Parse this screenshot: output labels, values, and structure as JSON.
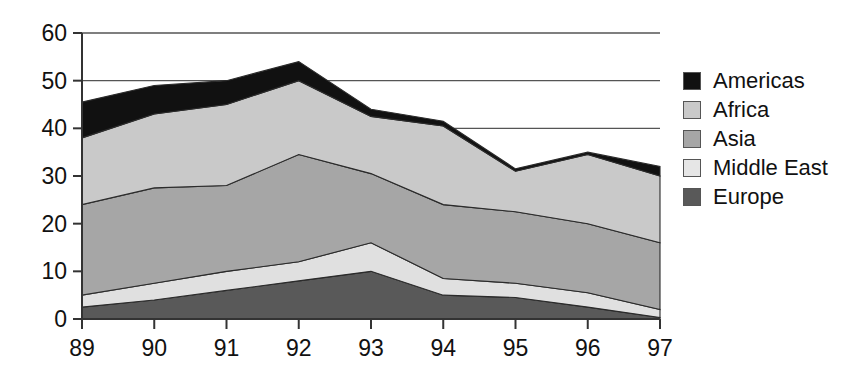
{
  "chart_data": {
    "type": "area",
    "stacked": true,
    "title": "",
    "xlabel": "",
    "ylabel": "",
    "categories": [
      "89",
      "90",
      "91",
      "92",
      "93",
      "94",
      "95",
      "96",
      "97"
    ],
    "x": [
      89,
      90,
      91,
      92,
      93,
      94,
      95,
      96,
      97
    ],
    "ylim": [
      0,
      60
    ],
    "yticks": [
      0,
      10,
      20,
      30,
      40,
      50,
      60
    ],
    "grid": "horizontal",
    "legend_position": "right",
    "stack_order_bottom_to_top": [
      "Europe",
      "Middle East",
      "Asia",
      "Africa",
      "Americas"
    ],
    "series": [
      {
        "name": "Europe",
        "color": "#595959",
        "values": [
          2.5,
          4.0,
          6.0,
          8.0,
          10.0,
          5.0,
          4.5,
          2.5,
          0.3
        ]
      },
      {
        "name": "Middle East",
        "color": "#e0e0e0",
        "values": [
          2.5,
          3.5,
          4.0,
          4.0,
          6.0,
          3.5,
          3.0,
          3.0,
          1.7
        ]
      },
      {
        "name": "Asia",
        "color": "#a6a6a6",
        "values": [
          19.0,
          20.0,
          18.0,
          22.5,
          14.5,
          15.5,
          15.0,
          14.5,
          14.0
        ]
      },
      {
        "name": "Africa",
        "color": "#c9c9c9",
        "values": [
          14.0,
          15.5,
          17.0,
          15.5,
          12.0,
          16.5,
          8.5,
          14.5,
          14.0
        ]
      },
      {
        "name": "Americas",
        "color": "#111111",
        "values": [
          7.5,
          6.0,
          5.0,
          4.0,
          1.5,
          1.0,
          0.5,
          0.5,
          2.0
        ]
      }
    ],
    "cumulative_tops": {
      "Europe": [
        2.5,
        4.0,
        6.0,
        8.0,
        10.0,
        5.0,
        4.5,
        2.5,
        0.3
      ],
      "Middle East": [
        5.0,
        7.5,
        10.0,
        12.0,
        16.0,
        8.5,
        7.5,
        5.5,
        2.0
      ],
      "Asia": [
        24.0,
        27.5,
        28.0,
        34.5,
        30.5,
        24.0,
        22.5,
        20.0,
        16.0
      ],
      "Africa": [
        38.0,
        43.0,
        45.0,
        50.0,
        42.5,
        40.5,
        31.0,
        34.5,
        30.0
      ],
      "Americas": [
        45.5,
        49.0,
        50.0,
        54.0,
        44.0,
        41.5,
        31.5,
        35.0,
        32.0
      ]
    },
    "totals": [
      45.5,
      49.0,
      50.0,
      54.0,
      44.0,
      41.5,
      31.5,
      35.0,
      32.0
    ],
    "axis_color": "#333333",
    "gridline_color": "#555555"
  },
  "legend": {
    "items": [
      {
        "label": "Americas",
        "color": "#111111"
      },
      {
        "label": "Africa",
        "color": "#c9c9c9"
      },
      {
        "label": "Asia",
        "color": "#a6a6a6"
      },
      {
        "label": "Middle East",
        "color": "#e6e6e6"
      },
      {
        "label": "Europe",
        "color": "#595959"
      }
    ]
  },
  "axes": {
    "y_tick_labels": [
      "60",
      "50",
      "40",
      "30",
      "20",
      "10",
      "0"
    ],
    "x_tick_labels": [
      "89",
      "90",
      "91",
      "92",
      "93",
      "94",
      "95",
      "96",
      "97"
    ]
  }
}
